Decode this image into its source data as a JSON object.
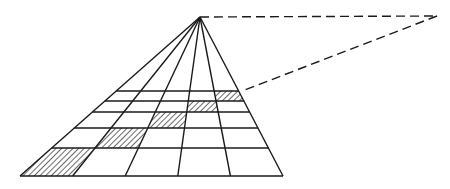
{
  "diagram": {
    "type": "perspective-grid",
    "colors": {
      "ink": "#1a1a1a",
      "paper": "#ffffff"
    },
    "vanishing_point": [
      200,
      17
    ],
    "distance_point": [
      437,
      16
    ],
    "diagonal_end": [
      242,
      91
    ],
    "baseline": {
      "y": 176,
      "x_points": [
        20,
        72.6,
        125.2,
        177.8,
        230.4,
        283
      ]
    },
    "horizontal_lines_y": [
      91,
      101,
      112,
      128,
      148,
      176
    ],
    "hatched_cells": [
      {
        "row": 4,
        "col": 0
      },
      {
        "row": 3,
        "col": 1
      },
      {
        "row": 2,
        "col": 2
      },
      {
        "row": 1,
        "col": 3
      },
      {
        "row": 0,
        "col": 4
      }
    ]
  }
}
